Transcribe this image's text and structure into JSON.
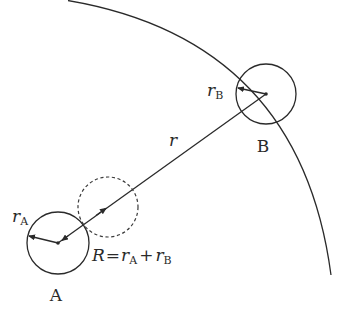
{
  "diagram": {
    "colors": {
      "stroke": "#2a2a2a",
      "background": "#ffffff"
    },
    "particle_a": {
      "label": "A",
      "radius_symbol": "r",
      "radius_subscript": "A"
    },
    "particle_b": {
      "label": "B",
      "radius_symbol": "r",
      "radius_subscript": "B"
    },
    "separation": {
      "label": "r"
    },
    "collision_radius": {
      "lhs": "R",
      "equals": "=",
      "term1_symbol": "r",
      "term1_subscript": "A",
      "plus": "+",
      "term2_symbol": "r",
      "term2_subscript": "B"
    },
    "elements": [
      "large arc (sphere of radius r around A)",
      "solid circle A (radius rA)",
      "solid circle B (radius rB)",
      "dashed circle (radius R = rA + rB)",
      "line from A center to B center"
    ]
  }
}
